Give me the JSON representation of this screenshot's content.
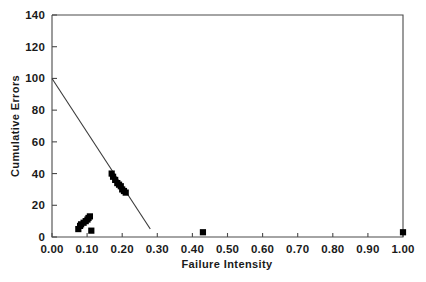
{
  "chart_data": {
    "type": "scatter",
    "title": "",
    "xlabel": "Failure Intensity",
    "ylabel": "Cumulative Errors",
    "xlim": [
      0.0,
      1.0
    ],
    "ylim": [
      0,
      140
    ],
    "grid": false,
    "legend": "none",
    "xticks": [
      "0.00",
      "0.10",
      "0.20",
      "0.30",
      "0.40",
      "0.50",
      "0.60",
      "0.70",
      "0.80",
      "0.90",
      "1.00"
    ],
    "xtick_values": [
      0.0,
      0.1,
      0.2,
      0.3,
      0.4,
      0.5,
      0.6,
      0.7,
      0.8,
      0.9,
      1.0
    ],
    "yticks": [
      "0",
      "20",
      "40",
      "60",
      "80",
      "100",
      "120",
      "140"
    ],
    "ytick_values": [
      0,
      20,
      40,
      60,
      80,
      100,
      120,
      140
    ],
    "marker": "filled-square",
    "marker_color": "#000000",
    "series": [
      {
        "name": "observations",
        "x": [
          0.075,
          0.08,
          0.083,
          0.09,
          0.096,
          0.101,
          0.104,
          0.108,
          0.112,
          0.17,
          0.174,
          0.18,
          0.186,
          0.191,
          0.196,
          0.2,
          0.205,
          0.21,
          0.43,
          1.0
        ],
        "y": [
          5,
          7,
          8,
          9,
          10,
          11,
          12,
          13,
          4,
          40,
          38,
          36,
          34,
          33,
          32,
          30,
          29,
          28,
          3,
          3
        ]
      }
    ],
    "fit_line": {
      "name": "least-squares fit",
      "x": [
        0.0,
        0.28
      ],
      "y": [
        100,
        5
      ],
      "color": "#3a3a3a"
    }
  },
  "axes": {
    "x_title": "Failure Intensity",
    "y_title": "Cumulative Errors"
  }
}
